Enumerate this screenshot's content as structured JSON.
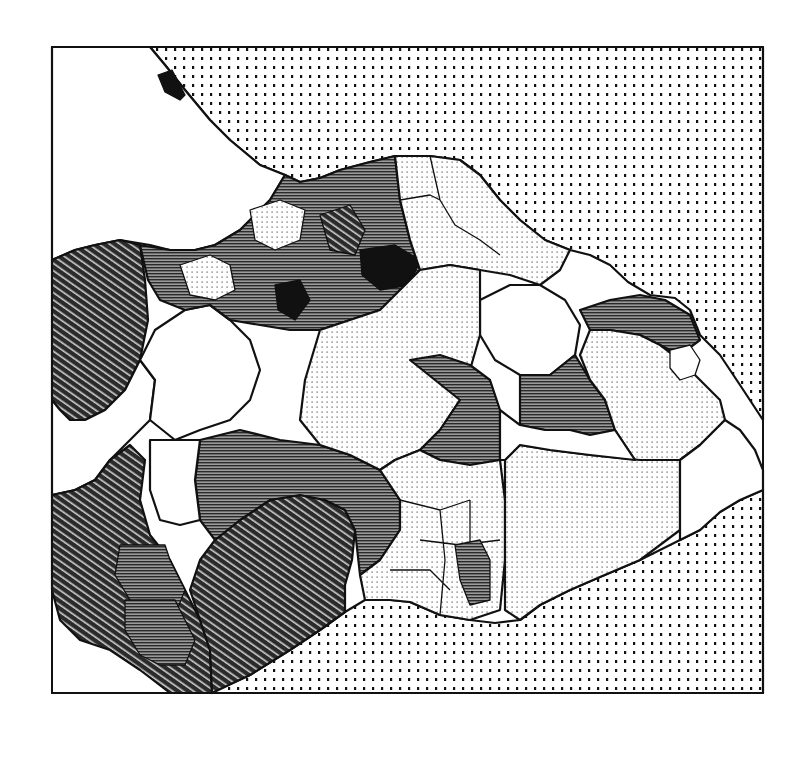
{
  "figure": {
    "type": "choropleth-map",
    "rendering": "monochrome hatch patterns",
    "frame": {
      "x": 52,
      "y": 47,
      "width": 711,
      "height": 646
    },
    "colors": {
      "ink": "#111111",
      "paper": "#ffffff"
    }
  },
  "legend_classes": [
    {
      "id": "sea",
      "pattern": "coarse-dots",
      "description": "sea / water area"
    },
    {
      "id": "c0",
      "pattern": "white",
      "description": "lowest class (blank)"
    },
    {
      "id": "c1",
      "pattern": "fine-dots",
      "description": "low class (light stipple)"
    },
    {
      "id": "c2",
      "pattern": "horizontal-lines",
      "description": "medium-high class (horizontal hatch)"
    },
    {
      "id": "c3",
      "pattern": "diagonal-lines",
      "description": "high class (dense diagonal hatch)"
    },
    {
      "id": "c4",
      "pattern": "solid-black",
      "description": "highest class (solid)"
    }
  ],
  "regions": {
    "sea_north": "c_sea",
    "sea_south": "c_sea",
    "nw_large_white": "c0",
    "west_diagonal": "c3",
    "southwest_diagonal": "c3",
    "south_central_diagonal": "c3",
    "central_horizontal": "c2",
    "north_central_cluster": "c2",
    "east_white_lake": "c0",
    "east_stipple": "c1",
    "southeast_stipple": "c1",
    "far_east_white": "c0"
  }
}
